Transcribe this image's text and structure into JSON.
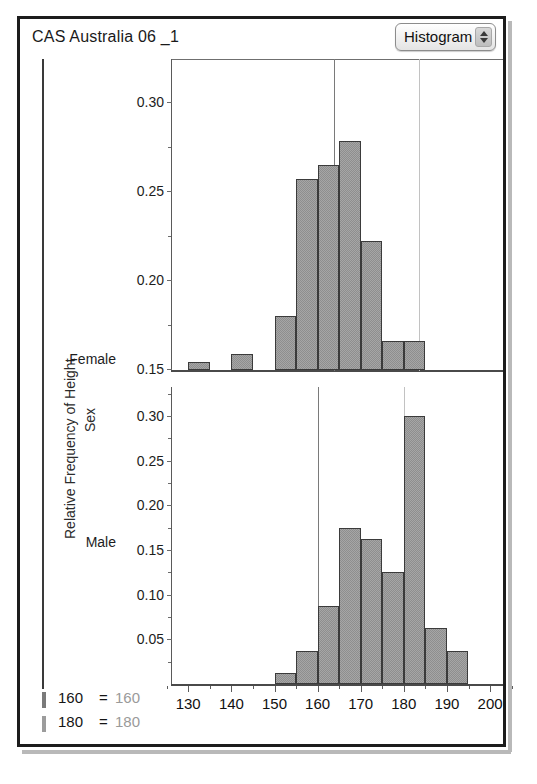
{
  "window": {
    "title": "CAS Australia 06 _1",
    "popup": {
      "value": "Histogram",
      "icon": "updown-stepper-icon"
    }
  },
  "axes": {
    "y_outer_label": "Relative Frequency of Height",
    "group_outer_label": "Sex",
    "x_title": "Height",
    "y_ticks": [
      "0.00",
      "0.05",
      "0.10",
      "0.15",
      "0.20",
      "0.25",
      "0.30"
    ],
    "y_ticks_bottom": [
      "0.05",
      "0.10",
      "0.15",
      "0.20",
      "0.25",
      "0.30"
    ],
    "x_ticks": [
      "130",
      "140",
      "150",
      "160",
      "170",
      "180",
      "190",
      "200"
    ]
  },
  "legend": {
    "rows": [
      {
        "key": "160",
        "eq": "=",
        "value": "160",
        "color": "#7a7a7a"
      },
      {
        "key": "180",
        "eq": "=",
        "value": "180",
        "color": "#9c9c9c"
      }
    ]
  },
  "colors": {
    "bar_fill": "#a6a6a6",
    "bar_stroke": "#3b3b3b",
    "refline_160": "#7a7a7a",
    "refline_180": "#bdbdbd",
    "frame": "#1c1c1c"
  },
  "chart_data": {
    "type": "bar",
    "title": "CAS Australia 06 _1",
    "xlabel": "Height",
    "ylabel": "Relative Frequency of Height",
    "grouping_label": "Sex",
    "xlim": [
      126,
      203
    ],
    "ylim": [
      0,
      0.325
    ],
    "bin_width": 5,
    "grid": false,
    "reference_lines": [
      {
        "label": "160 = 160",
        "x": 160,
        "color": "#7a7a7a"
      },
      {
        "label": "180 = 180",
        "x": 180,
        "color": "#bdbdbd"
      }
    ],
    "panels": [
      {
        "name": "Female",
        "bins": [
          {
            "x0": 130,
            "x1": 135,
            "value": 0.009
          },
          {
            "x0": 140,
            "x1": 145,
            "value": 0.018
          },
          {
            "x0": 150,
            "x1": 155,
            "value": 0.06
          },
          {
            "x0": 155,
            "x1": 160,
            "value": 0.214
          },
          {
            "x0": 160,
            "x1": 165,
            "value": 0.23
          },
          {
            "x0": 165,
            "x1": 170,
            "value": 0.256
          },
          {
            "x0": 170,
            "x1": 175,
            "value": 0.144
          },
          {
            "x0": 175,
            "x1": 180,
            "value": 0.033
          },
          {
            "x0": 180,
            "x1": 185,
            "value": 0.033
          }
        ]
      },
      {
        "name": "Male",
        "bins": [
          {
            "x0": 150,
            "x1": 155,
            "value": 0.0125
          },
          {
            "x0": 155,
            "x1": 160,
            "value": 0.0375
          },
          {
            "x0": 160,
            "x1": 165,
            "value": 0.0875
          },
          {
            "x0": 165,
            "x1": 170,
            "value": 0.175
          },
          {
            "x0": 170,
            "x1": 175,
            "value": 0.1625
          },
          {
            "x0": 175,
            "x1": 180,
            "value": 0.125
          },
          {
            "x0": 180,
            "x1": 185,
            "value": 0.3
          },
          {
            "x0": 185,
            "x1": 190,
            "value": 0.0625
          },
          {
            "x0": 190,
            "x1": 195,
            "value": 0.0375
          }
        ]
      }
    ]
  }
}
